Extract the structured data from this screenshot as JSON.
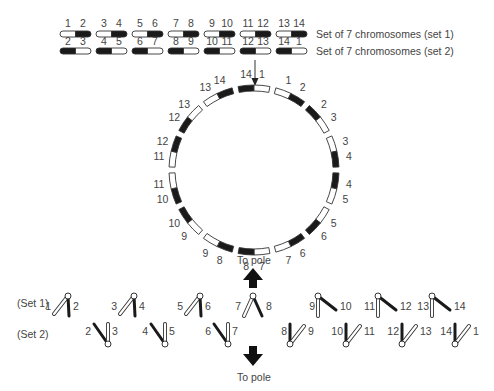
{
  "legend": {
    "set1": "Set of 7 chromosomes (set 1)",
    "set2": "Set of 7 chromosomes (set 2)"
  },
  "top_rows": {
    "set1": [
      {
        "left": "1",
        "right": "2",
        "pattern": "white-black"
      },
      {
        "left": "3",
        "right": "4",
        "pattern": "white-black"
      },
      {
        "left": "5",
        "right": "6",
        "pattern": "white-black"
      },
      {
        "left": "7",
        "right": "8",
        "pattern": "white-black"
      },
      {
        "left": "9",
        "right": "10",
        "pattern": "white-black"
      },
      {
        "left": "11",
        "right": "12",
        "pattern": "white-black"
      },
      {
        "left": "13",
        "right": "14",
        "pattern": "white-black"
      }
    ],
    "set2": [
      {
        "left": "2",
        "right": "3",
        "pattern": "black-white"
      },
      {
        "left": "4",
        "right": "5",
        "pattern": "black-white"
      },
      {
        "left": "6",
        "right": "7",
        "pattern": "black-white"
      },
      {
        "left": "8",
        "right": "9",
        "pattern": "black-white"
      },
      {
        "left": "10",
        "right": "11",
        "pattern": "black-white"
      },
      {
        "left": "12",
        "right": "13",
        "pattern": "black-white"
      },
      {
        "left": "14",
        "right": "1",
        "pattern": "black-white"
      }
    ]
  },
  "ring": {
    "chromosomes": [
      {
        "a": "14",
        "b": "1",
        "pattern": "black-white"
      },
      {
        "a": "1",
        "b": "2",
        "pattern": "white-black"
      },
      {
        "a": "2",
        "b": "3",
        "pattern": "black-white"
      },
      {
        "a": "3",
        "b": "4",
        "pattern": "white-black"
      },
      {
        "a": "4",
        "b": "5",
        "pattern": "black-white"
      },
      {
        "a": "5",
        "b": "6",
        "pattern": "white-black"
      },
      {
        "a": "6",
        "b": "7",
        "pattern": "black-white"
      },
      {
        "a": "7",
        "b": "8",
        "pattern": "white-black"
      },
      {
        "a": "8",
        "b": "9",
        "pattern": "black-white"
      },
      {
        "a": "9",
        "b": "10",
        "pattern": "white-black"
      },
      {
        "a": "10",
        "b": "11",
        "pattern": "black-white"
      },
      {
        "a": "11",
        "b": "12",
        "pattern": "white-black"
      },
      {
        "a": "12",
        "b": "13",
        "pattern": "black-white"
      },
      {
        "a": "13",
        "b": "14",
        "pattern": "white-black"
      }
    ]
  },
  "segregation": {
    "pole_top": "To pole",
    "pole_bottom": "To pole",
    "set1_label": "(Set 1)",
    "set2_label": "(Set 2)",
    "set1": [
      {
        "left": "1",
        "right": "2"
      },
      {
        "left": "3",
        "right": "4"
      },
      {
        "left": "5",
        "right": "6"
      },
      {
        "left": "7",
        "right": "8"
      },
      {
        "left": "9",
        "right": "10"
      },
      {
        "left": "11",
        "right": "12"
      },
      {
        "left": "13",
        "right": "14"
      }
    ],
    "set2": [
      {
        "left": "2",
        "right": "3"
      },
      {
        "left": "4",
        "right": "5"
      },
      {
        "left": "6",
        "right": "7"
      },
      {
        "left": "8",
        "right": "9"
      },
      {
        "left": "10",
        "right": "11"
      },
      {
        "left": "12",
        "right": "13"
      },
      {
        "left": "14",
        "right": "1"
      }
    ]
  },
  "colors": {
    "dark": "#1a1a1a",
    "light": "#ffffff",
    "outline": "#333333",
    "text": "#444444"
  }
}
